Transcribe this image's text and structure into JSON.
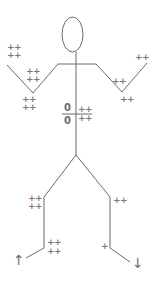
{
  "diagram": {
    "type": "stick-figure",
    "colors": {
      "line": "#6b6b6b",
      "label": "#7a7a7a",
      "background": "#ffffff"
    },
    "labels": {
      "left_hand_top": "++",
      "left_hand_bottom": "++",
      "left_arm_inner_top": "++",
      "left_arm_inner_bottom": "++",
      "left_elbow_top": "++",
      "left_elbow_bottom": "++",
      "right_hand": "++",
      "right_arm_inner": "++",
      "right_elbow": "++",
      "torso_numerator": "0",
      "torso_denominator": "0",
      "torso_right_top": "++",
      "torso_right_bottom": "++",
      "left_knee_top": "++",
      "left_knee_bottom": "++",
      "left_ankle_top": "++",
      "left_ankle_bottom": "++",
      "right_knee": "++",
      "right_ankle": "+"
    },
    "arrows": {
      "left_foot": "↑",
      "right_foot": "↓"
    }
  }
}
